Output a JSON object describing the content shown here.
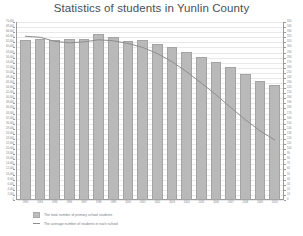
{
  "chart": {
    "title": "Statistics of students in Yunlin County",
    "legend": {
      "bars_label": "The total number of primary school students",
      "line_label": "The average number of students in each school"
    }
  },
  "chart_data": {
    "type": "bar",
    "title": "Statistics of students in Yunlin County",
    "xlabel": "",
    "ylabel": "",
    "grid": true,
    "legend_position": "bottom-left",
    "categories": [
      "1993",
      "1994",
      "1995",
      "1996",
      "1997",
      "1998",
      "1999",
      "2000",
      "2001",
      "2002",
      "2003",
      "2004",
      "2005",
      "2006",
      "2007",
      "2008",
      "2009",
      "2010"
    ],
    "y_left_label": "Total number of primary school students",
    "y_right_label": "Average number of students in each school",
    "ylim": [
      0,
      70000
    ],
    "y2lim": [
      0,
      350
    ],
    "y_ticks": [
      0,
      2000,
      4000,
      6000,
      8000,
      10000,
      12000,
      14000,
      16000,
      18000,
      20000,
      22000,
      24000,
      26000,
      28000,
      30000,
      32000,
      34000,
      36000,
      38000,
      40000,
      42000,
      44000,
      46000,
      48000,
      50000,
      52000,
      54000,
      56000,
      58000,
      60000,
      62000,
      64000,
      66000,
      68000,
      70000
    ],
    "y2_ticks": [
      0,
      10,
      20,
      30,
      40,
      50,
      60,
      70,
      80,
      90,
      100,
      110,
      120,
      130,
      140,
      150,
      160,
      170,
      180,
      190,
      200,
      210,
      220,
      230,
      240,
      250,
      260,
      270,
      280,
      290,
      300,
      310,
      320,
      330,
      340,
      350
    ],
    "series": [
      {
        "name": "The total number of primary school students",
        "type": "bar",
        "axis": "left",
        "values": [
          63000,
          63500,
          62800,
          63200,
          63400,
          65200,
          64000,
          62500,
          63000,
          61500,
          60200,
          58200,
          56300,
          54300,
          52200,
          49700,
          46800,
          45300
        ]
      },
      {
        "name": "The average number of students in each school",
        "type": "line",
        "axis": "right",
        "values": [
          322,
          320,
          312,
          309,
          311,
          315,
          313,
          308,
          300,
          288,
          272,
          252,
          230,
          207,
          182,
          158,
          136,
          118
        ]
      }
    ]
  }
}
